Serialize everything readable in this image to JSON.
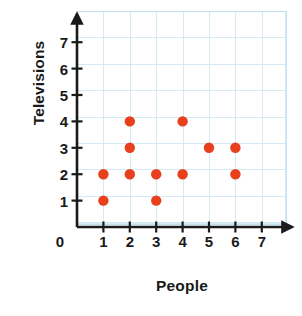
{
  "chart_data": {
    "type": "scatter",
    "title": "",
    "xlabel": "People",
    "ylabel": "Televisions",
    "xlim": [
      0,
      7
    ],
    "ylim": [
      0,
      7
    ],
    "xticks": [
      1,
      2,
      3,
      4,
      5,
      6,
      7
    ],
    "yticks": [
      1,
      2,
      3,
      4,
      5,
      6,
      7
    ],
    "xtick_labels": [
      "1",
      "2",
      "3",
      "4",
      "5",
      "6",
      "7"
    ],
    "ytick_labels": [
      "1",
      "2",
      "3",
      "4",
      "5",
      "6",
      "7"
    ],
    "origin_label": "0",
    "grid": true,
    "legend": false,
    "marker_color": "#e8401c",
    "grid_color": "#d4eaf5",
    "axis_color": "#1a1a1a",
    "points": [
      {
        "x": 1,
        "y": 1
      },
      {
        "x": 1,
        "y": 2
      },
      {
        "x": 2,
        "y": 2
      },
      {
        "x": 2,
        "y": 3
      },
      {
        "x": 2,
        "y": 4
      },
      {
        "x": 3,
        "y": 1
      },
      {
        "x": 3,
        "y": 2
      },
      {
        "x": 4,
        "y": 2
      },
      {
        "x": 4,
        "y": 4
      },
      {
        "x": 5,
        "y": 3
      },
      {
        "x": 6,
        "y": 2
      },
      {
        "x": 6,
        "y": 3
      }
    ],
    "point_count": 12
  }
}
